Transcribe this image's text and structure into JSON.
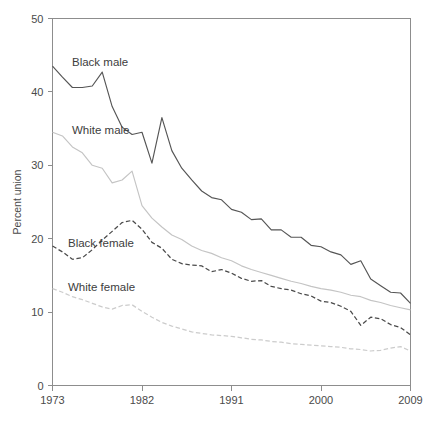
{
  "chart_data": {
    "type": "line",
    "title": "",
    "subtitle": "",
    "xlabel": "",
    "ylabel": "Percent union",
    "xlim": [
      1973,
      2009
    ],
    "ylim": [
      0,
      50
    ],
    "grid": false,
    "legend_position": "inline-annotations",
    "y_ticks": [
      "0",
      "10",
      "20",
      "30",
      "40",
      "50"
    ],
    "y_tick_values": [
      0,
      10,
      20,
      30,
      40,
      50
    ],
    "x_ticks": [
      "1973",
      "1982",
      "1991",
      "2000",
      "2009"
    ],
    "x_tick_values": [
      1973,
      1982,
      1991,
      2000,
      2009
    ],
    "x": [
      1973,
      1974,
      1975,
      1976,
      1977,
      1978,
      1979,
      1980,
      1981,
      1982,
      1983,
      1984,
      1985,
      1986,
      1987,
      1988,
      1989,
      1990,
      1991,
      1992,
      1993,
      1994,
      1995,
      1996,
      1997,
      1998,
      1999,
      2000,
      2001,
      2002,
      2003,
      2004,
      2005,
      2006,
      2007,
      2008,
      2009
    ],
    "series": [
      {
        "name": "Black male",
        "color": "#555555",
        "style": "solid",
        "values": [
          43.5,
          42.0,
          40.6,
          40.6,
          40.8,
          42.7,
          38.0,
          35.2,
          34.2,
          34.5,
          30.3,
          36.5,
          32.0,
          29.6,
          28.0,
          26.5,
          25.6,
          25.3,
          24.0,
          23.6,
          22.6,
          22.7,
          21.2,
          21.2,
          20.2,
          20.2,
          19.1,
          18.9,
          18.2,
          17.8,
          16.5,
          17.0,
          14.5,
          13.6,
          12.7,
          12.6,
          11.2
        ]
      },
      {
        "name": "White male",
        "color": "#c4c4c4",
        "style": "solid",
        "values": [
          34.5,
          34.0,
          32.5,
          31.7,
          30.0,
          29.6,
          27.6,
          28.0,
          29.2,
          24.5,
          22.8,
          21.6,
          20.5,
          19.9,
          19.0,
          18.4,
          18.0,
          17.4,
          17.0,
          16.3,
          15.8,
          15.4,
          15.0,
          14.6,
          14.2,
          13.9,
          13.5,
          13.2,
          13.0,
          12.7,
          12.3,
          12.1,
          11.6,
          11.3,
          10.9,
          10.6,
          10.3
        ]
      },
      {
        "name": "Black female",
        "color": "#4a4a4a",
        "style": "dashed",
        "values": [
          19.0,
          18.2,
          17.2,
          17.4,
          18.5,
          19.8,
          21.0,
          22.2,
          22.5,
          21.3,
          19.5,
          18.7,
          17.2,
          16.6,
          16.4,
          16.3,
          15.5,
          15.8,
          15.3,
          14.6,
          14.2,
          14.3,
          13.5,
          13.2,
          13.0,
          12.5,
          12.2,
          11.5,
          11.3,
          10.8,
          10.1,
          8.2,
          9.3,
          9.1,
          8.3,
          7.9,
          6.9
        ]
      },
      {
        "name": "White female",
        "color": "#cccccc",
        "style": "dashed",
        "values": [
          13.2,
          12.7,
          12.1,
          11.7,
          11.2,
          10.7,
          10.4,
          10.9,
          11.0,
          10.1,
          9.3,
          8.6,
          8.1,
          7.7,
          7.3,
          7.1,
          6.9,
          6.8,
          6.7,
          6.5,
          6.3,
          6.2,
          6.0,
          5.9,
          5.7,
          5.6,
          5.5,
          5.4,
          5.3,
          5.2,
          5.0,
          4.9,
          4.7,
          4.8,
          5.1,
          5.3,
          4.7
        ]
      }
    ],
    "annotations": [
      {
        "text": "Black male",
        "x_px": 72,
        "y_px": 66
      },
      {
        "text": "White male",
        "x_px": 72,
        "y_px": 134
      },
      {
        "text": "Black female",
        "x_px": 68,
        "y_px": 247
      },
      {
        "text": "White female",
        "x_px": 68,
        "y_px": 291
      }
    ]
  }
}
